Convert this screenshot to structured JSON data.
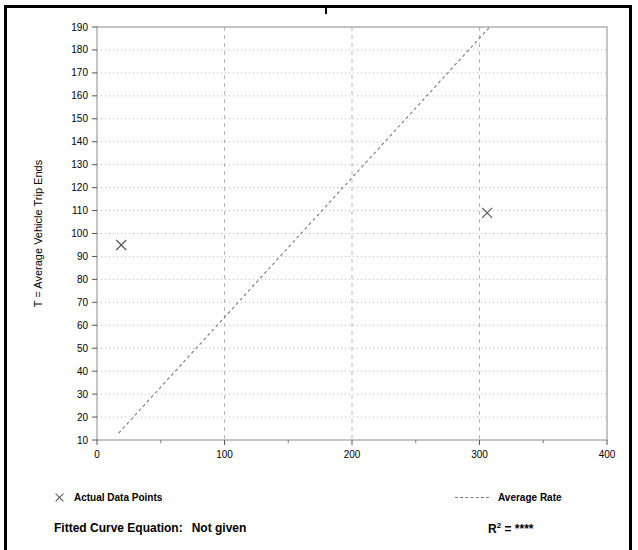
{
  "chart_data": {
    "type": "scatter",
    "title": "",
    "xlabel": "X = Number of Employees",
    "ylabel": "T = Average Vehicle Trip Ends",
    "xlim": [
      0,
      400
    ],
    "ylim": [
      10,
      190
    ],
    "x_ticks": [
      0,
      100,
      200,
      300,
      400
    ],
    "x_tick_labels": [
      "0",
      "100",
      "200",
      "300",
      "400"
    ],
    "x_minor_step": 50,
    "y_ticks": [
      10,
      20,
      30,
      40,
      50,
      60,
      70,
      80,
      90,
      100,
      110,
      120,
      130,
      140,
      150,
      160,
      170,
      180,
      190
    ],
    "y_tick_labels": [
      "10",
      "20",
      "30",
      "40",
      "50",
      "60",
      "70",
      "80",
      "90",
      "100",
      "110",
      "120",
      "130",
      "140",
      "150",
      "160",
      "170",
      "180",
      "190"
    ],
    "grid": {
      "horizontal": "dotted",
      "vertical": "dashed",
      "color": "#b8b8b8"
    },
    "legend_position": "below-plot",
    "series": [
      {
        "name": "Actual Data Points",
        "type": "scatter",
        "marker": "x",
        "color": "#555555",
        "points": [
          {
            "x": 19,
            "y": 95
          },
          {
            "x": 306,
            "y": 109
          }
        ]
      },
      {
        "name": "Average Rate",
        "type": "line",
        "style": "dashed",
        "color": "#777777",
        "points": [
          {
            "x": 17,
            "y": 13
          },
          {
            "x": 308,
            "y": 190
          }
        ]
      }
    ]
  },
  "legend": {
    "data_points_label": "Actual Data Points",
    "average_rate_label": "Average Rate"
  },
  "footer": {
    "equation_label": "Fitted Curve Equation:",
    "equation_value": "Not given",
    "r2_label": "R",
    "r2_exponent": "2",
    "r2_equals": "=",
    "r2_value": "****"
  }
}
